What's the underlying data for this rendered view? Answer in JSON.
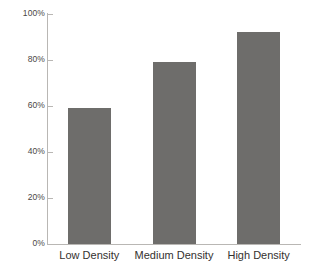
{
  "chart_data": {
    "type": "bar",
    "title": "",
    "subtitle": "",
    "xlabel": "",
    "ylabel": "",
    "categories": [
      "Low Density",
      "Medium Density",
      "High Density"
    ],
    "values": [
      59,
      79,
      92
    ],
    "value_suffix": "%",
    "ylim": [
      0,
      100
    ],
    "yticks": [
      0,
      20,
      40,
      60,
      80,
      100
    ],
    "ytick_labels": [
      "0%",
      "20%",
      "40%",
      "60%",
      "80%",
      "100%"
    ],
    "grid": false,
    "legend": null,
    "legend_position": "none",
    "series": [
      {
        "name": "",
        "values": [
          59,
          79,
          92
        ]
      }
    ],
    "annotations": []
  },
  "style": {
    "bar_color": "#6e6d6b",
    "axis_color": "#b9b7b4",
    "ytick_text_color": "#4a4745",
    "category_text_color": "#34312f",
    "background": "#ffffff"
  }
}
